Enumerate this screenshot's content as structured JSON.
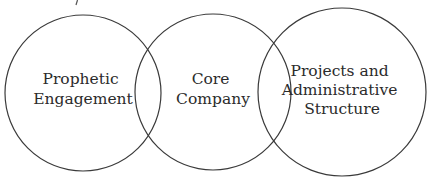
{
  "diagram": {
    "type": "venn",
    "stroke_color": "#3a3a3a",
    "text_color": "#2b2b2b",
    "circles": [
      {
        "id": "prophetic-engagement",
        "cx": 83,
        "cy": 93,
        "r": 78,
        "label_lines": [
          "Prophetic",
          "Engagement"
        ],
        "label_y": [
          84,
          104
        ]
      },
      {
        "id": "core-company",
        "cx": 213,
        "cy": 92,
        "r": 78,
        "label_lines": [
          "Core",
          "Company"
        ],
        "label_y": [
          84,
          104
        ]
      },
      {
        "id": "projects-and-administrative-structure",
        "cx": 342,
        "cy": 92,
        "r": 84,
        "label_lines": [
          "Projects and",
          "Administrative",
          "Structure"
        ],
        "label_y": [
          76,
          95,
          114
        ]
      }
    ]
  }
}
